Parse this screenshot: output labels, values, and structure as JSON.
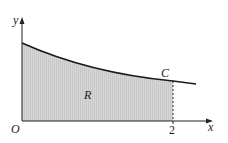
{
  "diagram": {
    "labels": {
      "y_axis": "y",
      "x_axis": "x",
      "origin": "O",
      "x_tick": "2",
      "curve": "C",
      "region": "R"
    },
    "colors": {
      "axis": "#222222",
      "curve": "#1a1a1a",
      "region_fill": "#d4d4d4",
      "background": "#ffffff"
    }
  }
}
